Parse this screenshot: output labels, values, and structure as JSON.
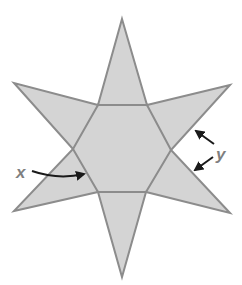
{
  "figure": {
    "shape": "six-pointed star (hexagram) with inner regular hexagon",
    "colors": {
      "fill": "#d4d4d4",
      "stroke": "#8c8c8c",
      "label": "#7f7f7f",
      "arrow": "#1a1a1a"
    },
    "labels": {
      "x": "x",
      "y": "y"
    },
    "annotations": {
      "x_points_to": "angle of inner hexagon at left vertex",
      "y_points_to": "two edges of the right star point"
    }
  }
}
